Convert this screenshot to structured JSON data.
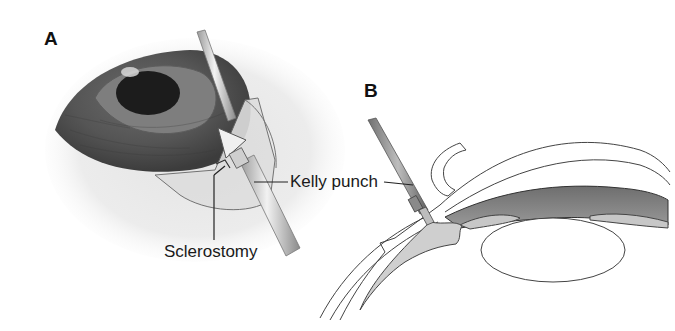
{
  "figure": {
    "panels": [
      {
        "id": "A",
        "label": "A",
        "description": "External view of eye with scleral flap reflected; Kelly punch creating sclerostomy",
        "callouts": [
          {
            "text": "Sclerostomy"
          },
          {
            "text": "Kelly punch"
          }
        ]
      },
      {
        "id": "B",
        "label": "B",
        "description": "Cross-section of anterior segment showing Kelly punch at limbus beneath scleral flap",
        "callouts": [
          {
            "text": "Kelly punch"
          }
        ]
      }
    ],
    "colors": {
      "background": "#ffffff",
      "line": "#333333",
      "iris_dark": "#4a4a4a",
      "iris_ring": "#7a7a7a",
      "pupil": "#1a1a1a",
      "sclera_shade": "#e6e6e6",
      "tissue_gray": "#bdbdbd",
      "label": "#111111"
    }
  }
}
